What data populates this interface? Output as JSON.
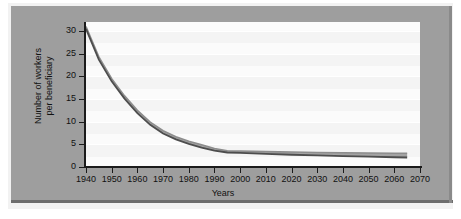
{
  "figure": {
    "background_color": "#9e9e9e",
    "panel_color": "#fbfbfb",
    "frame_color": "#f2f2f2"
  },
  "chart_data": {
    "type": "line",
    "title": "",
    "xlabel": "Years",
    "ylabel": "Number of workers per beneficiary",
    "ylabel_line1": "Number of workers",
    "ylabel_line2": "per beneficiary",
    "xlim": [
      1940,
      2070
    ],
    "ylim": [
      0,
      32
    ],
    "xticks": [
      1940,
      1950,
      1960,
      1970,
      1980,
      1990,
      2000,
      2010,
      2020,
      2030,
      2040,
      2050,
      2060,
      2070
    ],
    "xtick_labels": [
      "1940",
      "1950",
      "1960",
      "1970",
      "1980",
      "1990",
      "2000",
      "2010",
      "2020",
      "2030",
      "2040",
      "2050",
      "2060",
      "2070"
    ],
    "yticks": [
      0,
      5,
      10,
      15,
      20,
      25,
      30
    ],
    "ytick_labels": [
      "0",
      "5",
      "10",
      "15",
      "20",
      "25",
      "30"
    ],
    "grid": true,
    "grid_orientation": "horizontal",
    "legend": false,
    "legend_position": "none",
    "line_color": "#5a5a5a",
    "band_fill_color": "#9b9b9b",
    "band_edge_color": "#4a4a4a",
    "x": [
      1940,
      1945,
      1950,
      1955,
      1960,
      1965,
      1970,
      1975,
      1980,
      1985,
      1990,
      1995,
      2000,
      2005,
      2010,
      2020,
      2030,
      2040,
      2050,
      2060,
      2065
    ],
    "values": [
      30.8,
      24.0,
      19.2,
      15.4,
      12.2,
      9.6,
      7.7,
      6.4,
      5.4,
      4.6,
      3.9,
      3.4,
      3.35,
      3.3,
      3.25,
      3.15,
      3.05,
      3.0,
      2.95,
      2.9,
      2.9
    ],
    "series": [
      {
        "name": "Workers per beneficiary (upper bound)",
        "values": [
          31.0,
          24.3,
          19.5,
          15.7,
          12.5,
          9.9,
          8.0,
          6.7,
          5.7,
          4.9,
          4.1,
          3.6,
          3.5,
          3.45,
          3.4,
          3.3,
          3.2,
          3.15,
          3.1,
          3.05,
          3.05
        ]
      },
      {
        "name": "Workers per beneficiary (lower bound)",
        "values": [
          30.5,
          23.7,
          18.9,
          15.1,
          11.9,
          9.3,
          7.4,
          6.1,
          5.1,
          4.3,
          3.6,
          3.2,
          3.1,
          3.0,
          2.9,
          2.7,
          2.55,
          2.4,
          2.3,
          2.15,
          2.1
        ]
      }
    ],
    "annotations": []
  }
}
